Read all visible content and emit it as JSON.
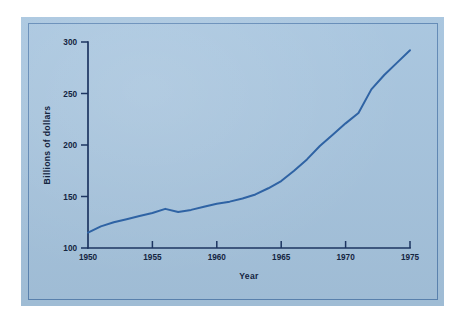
{
  "figure": {
    "panel_color": "#a6c4de",
    "panel_border_color": "#5d86b4",
    "page_color": "#ffffff",
    "axis_color": "#1d3561",
    "line_color": "#2f63a4"
  },
  "chart_data": {
    "type": "line",
    "title": "",
    "subtitle": "",
    "xlabel": "Year",
    "ylabel": "Billions of dollars",
    "xlim": [
      1950,
      1975
    ],
    "ylim": [
      100,
      300
    ],
    "xticks": [
      1950,
      1955,
      1960,
      1965,
      1970,
      1975
    ],
    "xtick_labels": [
      "1950",
      "1955",
      "1960",
      "1965",
      "1970",
      "1975"
    ],
    "yticks": [
      100,
      150,
      200,
      250,
      300
    ],
    "ytick_labels": [
      "100",
      "150",
      "200",
      "250",
      "300"
    ],
    "grid": false,
    "legend": false,
    "legend_position": "none",
    "annotations": [],
    "x": [
      1950,
      1951,
      1952,
      1953,
      1954,
      1955,
      1956,
      1957,
      1958,
      1959,
      1960,
      1961,
      1962,
      1963,
      1964,
      1965,
      1966,
      1967,
      1968,
      1969,
      1970,
      1971,
      1972,
      1973,
      1974,
      1975
    ],
    "series": [
      {
        "name": "Billions of dollars",
        "color": "#2f63a4",
        "values": [
          115,
          121,
          125,
          128,
          131,
          134,
          138,
          135,
          137,
          140,
          143,
          145,
          148,
          152,
          158,
          165,
          175,
          186,
          199,
          210,
          221,
          231,
          254,
          268,
          280,
          292
        ]
      }
    ]
  }
}
